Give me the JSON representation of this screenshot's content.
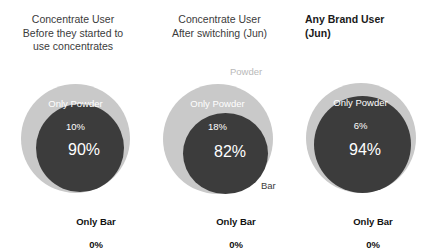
{
  "colors": {
    "background": "#ffffff",
    "outer_circle": "#c9c9c9",
    "inner_circle": "#3c3c3c",
    "powder_label_text": "#ffffff",
    "bar_label_text": "#111111",
    "title_text": "#3b3b3b",
    "callout_powder_text": "#b9b9b9",
    "callout_bar_text": "#3c3c3c"
  },
  "chart_data": {
    "type": "pie",
    "title": "",
    "subtitle": "",
    "legend": [
      "Powder",
      "Bar"
    ],
    "legend_position": "inline-callout-middle-panel",
    "panels": [
      {
        "title": "Concentrate User\nBefore they started to\nuse concentrates",
        "title_align": "center",
        "title_bold": false,
        "segments": [
          {
            "name": "Only Powder",
            "label": "Only Powder",
            "value_label": "10%",
            "value": 10,
            "color": "#c9c9c9"
          },
          {
            "name": "Both",
            "label": "",
            "value_label": "90%",
            "value": 90,
            "color": "#3c3c3c"
          },
          {
            "name": "Only Bar",
            "label": "Only Bar",
            "value_label": "0%",
            "value": 0,
            "color": "#111111"
          }
        ],
        "callouts": {
          "powder": "",
          "bar": ""
        }
      },
      {
        "title": "Concentrate User\nAfter switching (Jun)",
        "title_align": "center",
        "title_bold": false,
        "segments": [
          {
            "name": "Only Powder",
            "label": "Only Powder",
            "value_label": "18%",
            "value": 18,
            "color": "#c9c9c9"
          },
          {
            "name": "Both",
            "label": "",
            "value_label": "82%",
            "value": 82,
            "color": "#3c3c3c"
          },
          {
            "name": "Only Bar",
            "label": "Only Bar",
            "value_label": "0%",
            "value": 0,
            "color": "#111111"
          }
        ],
        "callouts": {
          "powder": "Powder",
          "bar": "Bar"
        }
      },
      {
        "title": "Any Brand User\n(Jun)",
        "title_align": "left",
        "title_bold": true,
        "segments": [
          {
            "name": "Only Powder",
            "label": "Only Powder",
            "value_label": "6%",
            "value": 6,
            "color": "#c9c9c9"
          },
          {
            "name": "Both",
            "label": "",
            "value_label": "94%",
            "value": 94,
            "color": "#3c3c3c"
          },
          {
            "name": "Only Bar",
            "label": "Only Bar",
            "value_label": "0%",
            "value": 0,
            "color": "#111111"
          }
        ],
        "callouts": {
          "powder": "",
          "bar": ""
        }
      }
    ]
  }
}
